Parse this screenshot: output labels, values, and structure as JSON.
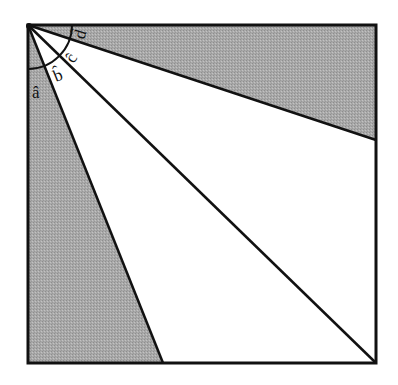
{
  "diagram": {
    "type": "geometry-angle-figure",
    "square": {
      "x1": 28,
      "y1": 25,
      "x2": 376,
      "y2": 363
    },
    "rays": [
      {
        "name": "ray-left",
        "to": [
          163,
          363
        ]
      },
      {
        "name": "ray-diagonal",
        "to": [
          376,
          363
        ]
      },
      {
        "name": "ray-right",
        "to": [
          376,
          140
        ]
      }
    ],
    "shaded_regions": [
      "between left edge and ray-left",
      "between top edge and ray-right"
    ],
    "arc_radius": 44,
    "colors": {
      "shade": "#a8a8a8",
      "stroke": "#111111",
      "background": "#ffffff"
    },
    "labels": [
      {
        "id": "a",
        "text": "â"
      },
      {
        "id": "b",
        "text": "b̂"
      },
      {
        "id": "c",
        "text": "ĉ"
      },
      {
        "id": "d",
        "text": "d̂"
      }
    ]
  }
}
